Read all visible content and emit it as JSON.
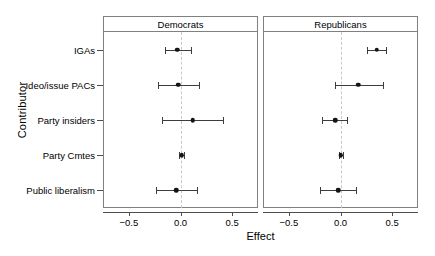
{
  "chart_data": {
    "type": "scatter",
    "title": "",
    "xlabel": "Effect",
    "ylabel": "Contributor",
    "xlim": [
      -0.75,
      0.75
    ],
    "grid": false,
    "legend": null,
    "reference_line": 0.0,
    "reference_line_style": "dashed",
    "panels": [
      "Democrats",
      "Republicans"
    ],
    "categories": [
      "IGAs",
      "Ideo/issue PACs",
      "Party insiders",
      "Party Cmtes",
      "Public liberalism"
    ],
    "xticks": [
      -0.5,
      0.0,
      0.5
    ],
    "xtick_labels": [
      "-0.5",
      "0.0",
      "0.5"
    ],
    "series": [
      {
        "name": "Democrats",
        "panel": "Democrats",
        "values": [
          -0.03,
          -0.02,
          0.12,
          0.01,
          -0.04
        ],
        "ci_low": [
          -0.15,
          -0.22,
          -0.18,
          -0.01,
          -0.24
        ],
        "ci_high": [
          0.1,
          0.18,
          0.41,
          0.03,
          0.16
        ]
      },
      {
        "name": "Republicans",
        "panel": "Republicans",
        "values": [
          0.35,
          0.17,
          -0.05,
          0.0,
          -0.02
        ],
        "ci_low": [
          0.26,
          -0.05,
          -0.18,
          -0.01,
          -0.2
        ],
        "ci_high": [
          0.44,
          0.41,
          0.06,
          0.02,
          0.15
        ]
      }
    ],
    "colors": {
      "point": "#141414",
      "whisker": "#3d3d3d",
      "zero_line": "#c9c9c9",
      "panel_border": "#808080",
      "background": "#ffffff"
    }
  },
  "axes": {
    "x_title": "Effect",
    "y_title": "Contributor"
  },
  "panel_labels": {
    "left": "Democrats",
    "right": "Republicans"
  },
  "ytick_labels": [
    "IGAs",
    "Ideo/issue PACs",
    "Party insiders",
    "Party Cmtes",
    "Public liberalism"
  ],
  "xtick_labels": [
    "-0.5",
    "0.0",
    "0.5"
  ]
}
